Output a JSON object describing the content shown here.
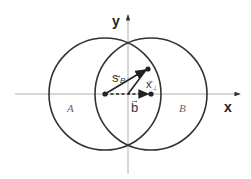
{
  "diagram": {
    "axes": {
      "x_label": "x",
      "y_label": "y"
    },
    "regions": {
      "left": "A",
      "right": "B"
    },
    "vectors": {
      "s_B": {
        "label": "s",
        "subscript": "B",
        "arrow": "→"
      },
      "x_perp": {
        "label": "x",
        "subscript": "⊥",
        "arrow": "→"
      },
      "b": {
        "label": "b",
        "arrow": "→"
      }
    },
    "colors": {
      "stroke": "#333333",
      "axis": "#999999",
      "background": "#ffffff"
    }
  }
}
